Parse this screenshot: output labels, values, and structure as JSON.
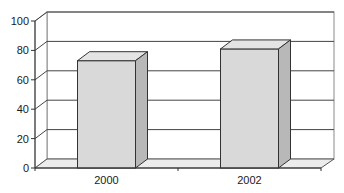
{
  "chart_data": {
    "type": "bar",
    "style": "3d-column",
    "title": "",
    "xlabel": "",
    "ylabel": "",
    "categories": [
      "2000",
      "2002"
    ],
    "values": [
      73,
      81
    ],
    "ylim": [
      0,
      100
    ],
    "yticks": [
      0,
      20,
      40,
      60,
      80,
      100
    ],
    "grid": true,
    "legend": null,
    "colors": {
      "bar_front": "#d9d9d9",
      "bar_top": "#e4e4e4",
      "bar_side": "#b8b8b8",
      "floor": "#ececec",
      "lines": "#333333",
      "grid": "#444444"
    }
  }
}
